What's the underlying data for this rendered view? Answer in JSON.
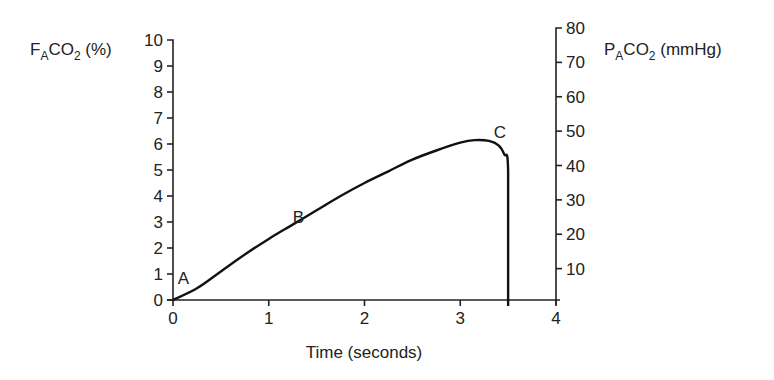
{
  "chart_data": {
    "type": "line",
    "title": "",
    "xlabel": "Time (seconds)",
    "ylabel_left": {
      "main": "F",
      "sub1": "A",
      "mid": "CO",
      "sub2": "2",
      "tail": " (%)"
    },
    "ylabel_right": {
      "main": "P",
      "sub1": "A",
      "mid": "CO",
      "sub2": "2",
      "tail": " (mmHg)"
    },
    "xlim": [
      0,
      4
    ],
    "ylim_left": [
      0,
      10
    ],
    "ylim_right": [
      0,
      80
    ],
    "x_ticks": [
      "0",
      "1",
      "2",
      "3",
      "4"
    ],
    "y_left_ticks": [
      "0",
      "1",
      "2",
      "3",
      "4",
      "5",
      "6",
      "7",
      "8",
      "9",
      "10"
    ],
    "y_right_ticks": [
      "10",
      "20",
      "30",
      "40",
      "50",
      "60",
      "70",
      "80"
    ],
    "grid": false,
    "series": [
      {
        "name": "Expired CO2",
        "x": [
          0,
          0.25,
          0.5,
          0.75,
          1.0,
          1.25,
          1.5,
          1.75,
          2.0,
          2.25,
          2.5,
          2.75,
          3.0,
          3.15,
          3.3,
          3.4,
          3.46,
          3.5,
          3.5
        ],
        "y": [
          0,
          0.45,
          1.1,
          1.75,
          2.35,
          2.9,
          3.45,
          4.0,
          4.5,
          4.95,
          5.4,
          5.75,
          6.05,
          6.15,
          6.12,
          5.95,
          5.6,
          5.0,
          0
        ]
      }
    ],
    "annotations": [
      {
        "text": "A",
        "x": 0.05,
        "y": 0.6
      },
      {
        "text": "B",
        "x": 1.25,
        "y": 2.95
      },
      {
        "text": "C",
        "x": 3.35,
        "y": 6.25
      }
    ]
  }
}
